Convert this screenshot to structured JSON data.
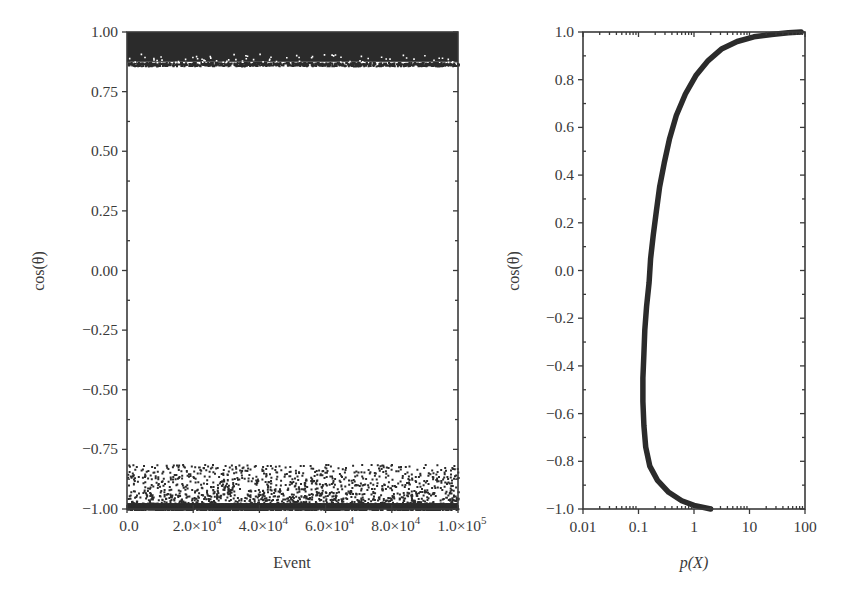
{
  "figure": {
    "panels": [
      "left",
      "right"
    ]
  },
  "chart_data": [
    {
      "id": "left",
      "type": "scatter",
      "title": "",
      "xlabel": "Event",
      "ylabel": "cos(θ)",
      "xlim": [
        0,
        100000
      ],
      "ylim": [
        -1.0,
        1.0
      ],
      "xticks": [
        0,
        20000,
        40000,
        60000,
        80000,
        100000
      ],
      "xtick_labels": [
        {
          "mant": "0.0",
          "exp": ""
        },
        {
          "mant": "2.0×10",
          "exp": "4"
        },
        {
          "mant": "4.0×10",
          "exp": "4"
        },
        {
          "mant": "6.0×10",
          "exp": "4"
        },
        {
          "mant": "8.0×10",
          "exp": "4"
        },
        {
          "mant": "1.0×10",
          "exp": "5"
        }
      ],
      "yticks": [
        1.0,
        0.75,
        0.5,
        0.25,
        0.0,
        -0.25,
        -0.5,
        -0.75,
        -1.0
      ],
      "ytick_labels": [
        "1.00",
        "0.75",
        "0.50",
        "0.25",
        "0.00",
        "−0.25",
        "−0.50",
        "−0.75",
        "−1.00"
      ],
      "grid": false,
      "series": [
        {
          "name": "forward band",
          "description": "dense band of points",
          "y_range": [
            0.86,
            1.0
          ],
          "n_points": 100000
        },
        {
          "name": "backward band",
          "description": "dense band with sparse outliers",
          "y_range": [
            -1.0,
            -0.81
          ],
          "dense_y_range": [
            -1.0,
            -0.95
          ]
        }
      ],
      "color": "#2b2b2b"
    },
    {
      "id": "right",
      "type": "line",
      "title": "",
      "xlabel": "p(X)",
      "ylabel": "cos(θ)",
      "xscale": "log",
      "xlim": [
        0.01,
        100
      ],
      "ylim": [
        -1.0,
        1.0
      ],
      "xticks": [
        0.01,
        0.1,
        1,
        10,
        100
      ],
      "xtick_labels": [
        "0.01",
        "0.1",
        "1",
        "10",
        "100"
      ],
      "yticks": [
        1.0,
        0.8,
        0.6,
        0.4,
        0.2,
        0.0,
        -0.2,
        -0.4,
        -0.6,
        -0.8,
        -1.0
      ],
      "ytick_labels": [
        "1.0",
        "0.8",
        "0.6",
        "0.4",
        "0.2",
        "0.0",
        "−0.2",
        "−0.4",
        "−0.6",
        "−0.8",
        "−1.0"
      ],
      "grid": false,
      "series": [
        {
          "name": "p(X) vs cos(θ)",
          "x": [
            2.0,
            1.0,
            0.6,
            0.35,
            0.22,
            0.16,
            0.135,
            0.125,
            0.12,
            0.12,
            0.125,
            0.13,
            0.14,
            0.155,
            0.165,
            0.185,
            0.21,
            0.24,
            0.29,
            0.36,
            0.48,
            0.7,
            1.1,
            1.8,
            3.2,
            6.0,
            12,
            25,
            50,
            85
          ],
          "y": [
            -1.0,
            -0.985,
            -0.965,
            -0.93,
            -0.88,
            -0.82,
            -0.74,
            -0.65,
            -0.55,
            -0.45,
            -0.35,
            -0.25,
            -0.15,
            -0.05,
            0.05,
            0.15,
            0.25,
            0.35,
            0.45,
            0.55,
            0.65,
            0.74,
            0.82,
            0.88,
            0.93,
            0.96,
            0.98,
            0.99,
            0.997,
            1.0
          ]
        }
      ],
      "color": "#2b2b2b"
    }
  ]
}
